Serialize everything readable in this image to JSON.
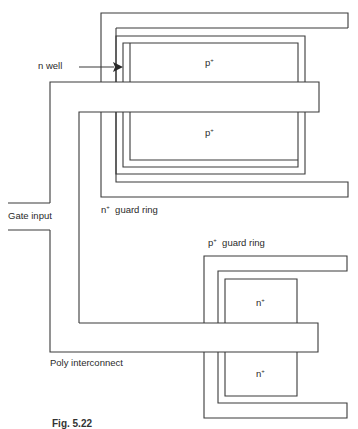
{
  "diagram": {
    "type": "CMOS inverter layout with guard rings",
    "labels": {
      "n_well": "n  well",
      "p_plus_top": "p",
      "p_plus_bottom": "p",
      "n_guard_ring_prefix": "n",
      "n_guard_ring_text": "guard ring",
      "gate_input": "Gate input",
      "p_guard_ring_prefix": "p",
      "p_guard_ring_text": "guard ring",
      "n_plus_top": "n",
      "n_plus_bottom": "n",
      "poly_interconnect": "Poly interconnect",
      "plus": "+"
    },
    "caption": "Fig. 5.22",
    "colors": {
      "line": "#3a3a3a",
      "background": "#ffffff",
      "text": "#2a2a2a"
    }
  }
}
